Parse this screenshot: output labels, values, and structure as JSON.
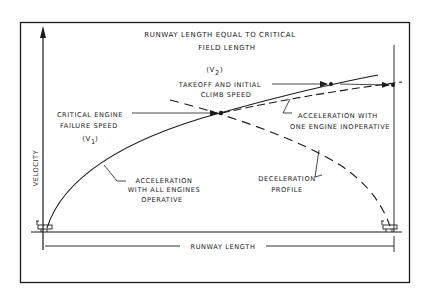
{
  "diagram": {
    "title_line1": "RUNWAY LENGTH EQUAL TO CRITICAL",
    "title_line2": "FIELD LENGTH",
    "y_axis_label": "VELOCITY",
    "x_axis_label": "RUNWAY LENGTH",
    "annotations": {
      "v2_symbol": "(V",
      "v2_sub": "2",
      "v2_close": ")",
      "v2_line1": "TAKEOFF AND INITIAL",
      "v2_line2": "CLIMB SPEED",
      "v1_line1": "CRITICAL ENGINE",
      "v1_line2": "FAILURE SPEED",
      "v1_symbol": "(V",
      "v1_sub": "1",
      "v1_close": ")",
      "engine_out_line1": "ACCELERATION WITH",
      "engine_out_line2": "ONE ENGINE INOPERATIVE",
      "all_engines_line1": "ACCELERATION",
      "all_engines_line2": "WITH ALL ENGINES",
      "all_engines_line3": "OPERATIVE",
      "decel_line1": "DECELERATION",
      "decel_line2": "PROFILE"
    },
    "curves": [
      {
        "name": "Acceleration with all engines operative",
        "style": "solid"
      },
      {
        "name": "Acceleration with one engine inoperative",
        "style": "dashed"
      },
      {
        "name": "Deceleration profile",
        "style": "dashed"
      }
    ],
    "ink_color": "#1a1a1a",
    "background_color": "#ffffff"
  }
}
